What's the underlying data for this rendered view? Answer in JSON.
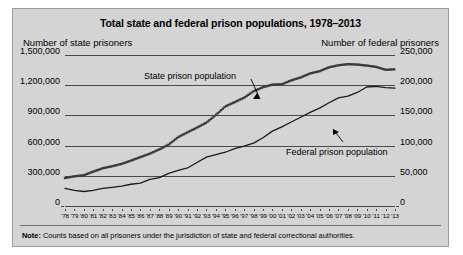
{
  "title": "Total state and federal prison populations, 1978–2013",
  "left_axis_caption": "Number of state prisoners",
  "right_axis_caption": "Number of federal prisoners",
  "annotations": {
    "state": "State prison population",
    "federal": "Federal prison population"
  },
  "note_prefix": "Note:",
  "note_text": " Counts based on all prisoners under the jurisdiction of state and federal correctional authorities.",
  "colors": {
    "panel_background": "#d4d4d4",
    "panel_border": "#9a9a9a",
    "gridline": "#4a4a4a",
    "state_series": "#3a3a3a",
    "federal_series": "#1a1a1a",
    "text": "#000000"
  },
  "chart_data": {
    "type": "line",
    "title": "Total state and federal prison populations, 1978–2013",
    "xlabel": "",
    "ylabel": "Number of state prisoners",
    "y2label": "Number of federal prisoners",
    "grid": true,
    "legend": "annotations-inline",
    "ylim": [
      0,
      1500000
    ],
    "y2lim": [
      0,
      250000
    ],
    "yticks": [
      0,
      300000,
      600000,
      900000,
      1200000,
      1500000
    ],
    "ytick_labels": [
      "0",
      "300,000",
      "600,000",
      "900,000",
      "1,200,000",
      "1,500,000"
    ],
    "y2ticks": [
      0,
      50000,
      100000,
      150000,
      200000,
      250000
    ],
    "y2tick_labels": [
      "0",
      "50,000",
      "100,000",
      "150,000",
      "200,000",
      "250,000"
    ],
    "x": [
      1978,
      1979,
      1980,
      1981,
      1982,
      1983,
      1984,
      1985,
      1986,
      1987,
      1988,
      1989,
      1990,
      1991,
      1992,
      1993,
      1994,
      1995,
      1996,
      1997,
      1998,
      1999,
      2000,
      2001,
      2002,
      2003,
      2004,
      2005,
      2006,
      2007,
      2008,
      2009,
      2010,
      2011,
      2012,
      2013
    ],
    "xtick_labels": [
      "'78",
      "'79",
      "'80",
      "'81",
      "'82",
      "'83",
      "'84",
      "'85",
      "'86",
      "'87",
      "'88",
      "'89",
      "'90",
      "'91",
      "'92",
      "'93",
      "'94",
      "'95",
      "'96",
      "'97",
      "'98",
      "'99",
      "'00",
      "'01",
      "'02",
      "'03",
      "'04",
      "'05",
      "'06",
      "'07",
      "'08",
      "'09",
      "'10",
      "'11",
      "'12",
      "'13"
    ],
    "series": [
      {
        "name": "State prison population",
        "axis": "left",
        "style": "dotted",
        "values": [
          278000,
          295000,
          306000,
          342000,
          375000,
          395000,
          418000,
          451000,
          486000,
          520000,
          562000,
          610000,
          684000,
          732000,
          779000,
          828000,
          904000,
          989000,
          1032000,
          1076000,
          1140000,
          1180000,
          1206000,
          1209000,
          1248000,
          1277000,
          1317000,
          1339000,
          1378000,
          1398000,
          1409000,
          1405000,
          1395000,
          1382000,
          1353000,
          1358000
        ]
      },
      {
        "name": "Federal prison population",
        "axis": "right",
        "style": "solid",
        "values": [
          29000,
          26000,
          24000,
          26000,
          29000,
          31000,
          33000,
          36000,
          38000,
          44000,
          47000,
          54000,
          59000,
          63000,
          72000,
          81000,
          85000,
          89000,
          95000,
          99000,
          104000,
          113000,
          124000,
          131000,
          139000,
          147000,
          155000,
          162000,
          171000,
          179000,
          182000,
          188000,
          197000,
          198000,
          196000,
          195000
        ]
      }
    ]
  }
}
